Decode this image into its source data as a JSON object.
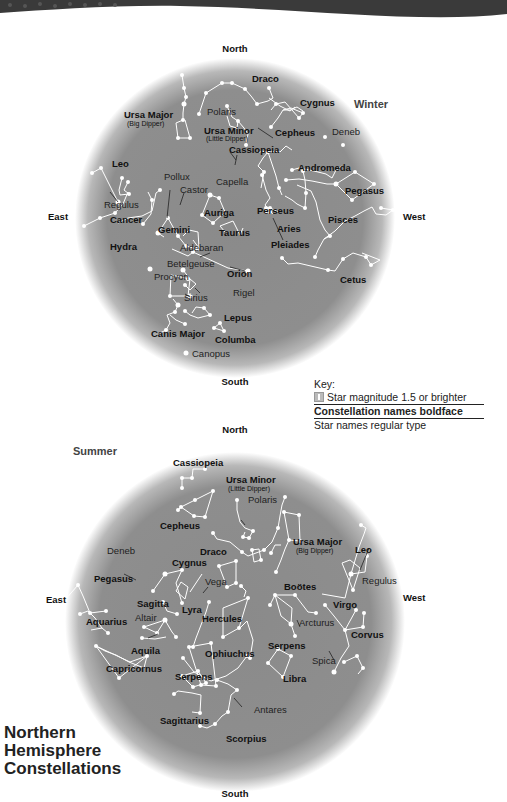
{
  "title": {
    "lines": [
      "Northern",
      "Hemisphere",
      "Constellations"
    ]
  },
  "key": {
    "heading": "Key:",
    "item_star": "Star magnitude 1.5 or brighter",
    "item_constellation": "Constellation names boldface",
    "item_starname": "Star names regular type"
  },
  "winter": {
    "season": "Winter",
    "directions": {
      "north": "North",
      "south": "South",
      "east": "East",
      "west": "West"
    },
    "constellations": [
      "Draco",
      "Cygnus",
      "Ursa Major",
      "Ursa Minor",
      "Cepheus",
      "Cassiopeia",
      "Leo",
      "Andromeda",
      "Pegasus",
      "Perseus",
      "Auriga",
      "Cancer",
      "Gemini",
      "Taurus",
      "Aries",
      "Pisces",
      "Pleiades",
      "Hydra",
      "Orion",
      "Cetus",
      "Lepus",
      "Canis Major",
      "Columba"
    ],
    "subtitles": {
      "ursa_major": "(Big Dipper)",
      "ursa_minor": "(Little Dipper)"
    },
    "stars": [
      "Polaris",
      "Deneb",
      "Pollux",
      "Castor",
      "Capella",
      "Regulus",
      "Aldebaran",
      "Betelgeuse",
      "Procyon",
      "Sirius",
      "Rigel",
      "Canopus"
    ]
  },
  "summer": {
    "season": "Summer",
    "directions": {
      "north": "North",
      "south": "South",
      "east": "East",
      "west": "West"
    },
    "constellations": [
      "Cassiopeia",
      "Ursa Minor",
      "Cepheus",
      "Ursa Major",
      "Leo",
      "Draco",
      "Cygnus",
      "Pegasus",
      "Boötes",
      "Sagitta",
      "Lyra",
      "Hercules",
      "Virgo",
      "Aquarius",
      "Aquila",
      "Ophiuchus",
      "Serpens",
      "Corvus",
      "Capricornus",
      "Serpens",
      "Libra",
      "Sagittarius",
      "Scorpius"
    ],
    "subtitles": {
      "ursa_major": "(Big Dipper)",
      "ursa_minor": "(Little Dipper)"
    },
    "stars": [
      "Polaris",
      "Deneb",
      "Vega",
      "Regulus",
      "Altair",
      "Arcturus",
      "Spica",
      "Antares"
    ]
  },
  "colors": {
    "sky_center": "#8a8a8a",
    "sky_edge": "#ffffff",
    "band": "#3a3a3a",
    "star": "#ffffff"
  }
}
